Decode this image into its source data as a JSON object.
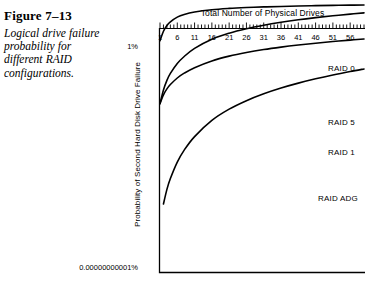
{
  "figure": {
    "number": "Figure 7–13",
    "caption": "Logical drive failure probability for different RAID configurations."
  },
  "chart_data": {
    "type": "line",
    "title": "Total Number of Physical Drives",
    "xlabel": "Total Number of Physical Drives",
    "ylabel": "Probability of Second Hard Disk Drive Failure",
    "yscale": "log",
    "ytick_labels": [
      "1%",
      "0.00000000001%"
    ],
    "ylim": [
      "0.00000000001%",
      "1%"
    ],
    "xlim": [
      1,
      60
    ],
    "xtick_labels": [
      "1",
      "6",
      "11",
      "16",
      "21",
      "26",
      "31",
      "36",
      "41",
      "46",
      "51",
      "56"
    ],
    "xticks": [
      1,
      6,
      11,
      16,
      21,
      26,
      31,
      36,
      41,
      46,
      51,
      56
    ],
    "minor_tick_interval": 1,
    "grid": false,
    "legend": "inline-right-labels",
    "line_color": "#000000",
    "series": [
      {
        "name": "RAID 0",
        "label": "RAID 0",
        "x": [
          1,
          2,
          3,
          4,
          6,
          8,
          11,
          16,
          21,
          26,
          31,
          36,
          41,
          46,
          51,
          56,
          60
        ],
        "y": [
          0.00295,
          0.0079,
          0.0145,
          0.0212,
          0.0345,
          0.0455,
          0.0585,
          0.0745,
          0.0855,
          0.0935,
          0.1,
          0.105,
          0.11,
          0.114,
          0.1175,
          0.1205,
          0.1225
        ]
      },
      {
        "name": "RAID 5",
        "label": "RAID 5",
        "x": [
          1,
          2,
          3,
          4,
          6,
          8,
          11,
          16,
          21,
          26,
          31,
          36,
          41,
          46,
          51,
          56,
          60
        ],
        "y": [
          4.2e-06,
          1.75e-05,
          4.75e-05,
          9.75e-05,
          0.000275,
          0.00057,
          0.00133,
          0.00345,
          0.00645,
          0.0103,
          0.0149,
          0.0202,
          0.0262,
          0.0327,
          0.0397,
          0.0472,
          0.0535
        ]
      },
      {
        "name": "RAID 1",
        "label": "RAID 1",
        "x": [
          1,
          2,
          3,
          4,
          6,
          8,
          11,
          16,
          21,
          26,
          31,
          36,
          41,
          46,
          51,
          56,
          60
        ],
        "y": [
          4.2e-06,
          1.05e-05,
          1.95e-05,
          3.05e-05,
          6.05e-05,
          0.0001,
          0.000178,
          0.00036,
          0.00059,
          0.00086,
          0.00117,
          0.00151,
          0.00188,
          0.00228,
          0.0027,
          0.00315,
          0.00353
        ]
      },
      {
        "name": "RAID ADG",
        "label": "RAID ADG",
        "x": [
          2,
          3,
          4,
          6,
          8,
          11,
          16,
          21,
          26,
          31,
          36,
          41,
          46,
          51,
          56,
          60
        ],
        "y": [
          1.2e-10,
          5.5e-10,
          1.7e-09,
          9.5e-09,
          3.3e-08,
          1.35e-07,
          7.3e-07,
          2.35e-06,
          5.7e-06,
          1.17e-05,
          2.13e-05,
          3.55e-05,
          5.55e-05,
          8.3e-05,
          0.000119,
          0.000155
        ]
      }
    ],
    "series_label_positions": [
      {
        "name": "RAID 0",
        "x": 328,
        "y": 64
      },
      {
        "name": "RAID 5",
        "x": 328,
        "y": 118
      },
      {
        "name": "RAID 1",
        "x": 328,
        "y": 148
      },
      {
        "name": "RAID ADG",
        "x": 318,
        "y": 194
      }
    ]
  }
}
